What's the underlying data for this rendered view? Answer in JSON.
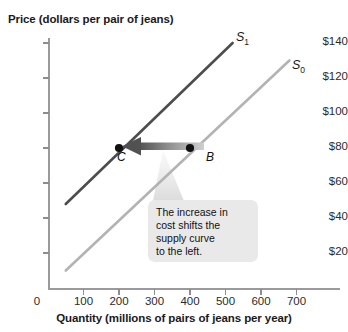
{
  "chart_data": {
    "type": "line",
    "title": "",
    "ylabel": "Price (dollars per pair of jeans)",
    "xlabel": "Quantity (millions of pairs of jeans per year)",
    "xlim": [
      0,
      750
    ],
    "ylim": [
      0,
      150
    ],
    "grid": false,
    "legend_position": "inline-curve-labels",
    "x_ticks": [
      "0",
      "100",
      "200",
      "300",
      "400",
      "500",
      "600",
      "700"
    ],
    "x_tick_values": [
      0,
      100,
      200,
      300,
      400,
      500,
      600,
      700
    ],
    "y_ticks": [
      "$20",
      "$40",
      "$60",
      "$80",
      "$100",
      "$120",
      "$140"
    ],
    "y_tick_values": [
      20,
      40,
      60,
      80,
      100,
      120,
      140
    ],
    "origin_label": "0",
    "series": [
      {
        "name": "S0",
        "label": "S",
        "subscript": "0",
        "color": "#b3b3b3",
        "x": [
          50,
          680
        ],
        "values": [
          10,
          130
        ]
      },
      {
        "name": "S1",
        "label": "S",
        "subscript": "1",
        "color": "#4d4d4d",
        "x": [
          50,
          520
        ],
        "values": [
          48,
          140
        ]
      }
    ],
    "points": [
      {
        "label": "C",
        "x": 200,
        "y": 80,
        "on_series": "S1",
        "color": "#111111"
      },
      {
        "label": "B",
        "x": 400,
        "y": 80,
        "on_series": "S0",
        "color": "#111111"
      }
    ],
    "annotations": [
      {
        "name": "shift-arrow",
        "type": "arrow",
        "from_x": 400,
        "from_y": 80,
        "to_x": 200,
        "to_y": 80,
        "direction": "left",
        "gradient_from": "#c9c9c9",
        "gradient_to": "#5a5a5a"
      },
      {
        "name": "callout",
        "type": "callout-box",
        "text": "The increase in\ncost shifts the\nsupply curve\nto the left.",
        "background": "#e9e9e9"
      }
    ]
  },
  "colors": {
    "s1_curve": "#4d4d4d",
    "s0_curve": "#b3b3b3",
    "axis": "#9a9a9a",
    "text": "#1a1a1a",
    "callout_bg": "#e9e9e9",
    "point": "#111111"
  }
}
